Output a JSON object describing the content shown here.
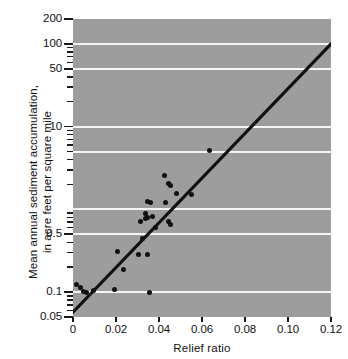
{
  "chart_data": {
    "type": "scatter",
    "title": "",
    "subtitle": "",
    "xlabel": "Relief ratio",
    "ylabel_line1": "Mean annual sediment accumulation,",
    "ylabel_line2": "in acre feet per square mile",
    "ylabel": "Mean annual sediment accumulation, in acre feet per square mile",
    "xscale": "linear",
    "yscale": "log",
    "xlim": [
      0,
      0.12
    ],
    "ylim": [
      0.05,
      200
    ],
    "grid": "horizontal-white-major",
    "legend": "none",
    "plot_background_color": "#9d9d9d",
    "gridline_color": "#f5f5f5",
    "marker_color": "#111111",
    "trendline_color": "#111111",
    "x_ticks": [
      "0",
      "0.02",
      "0.04",
      "0.06",
      "0.08",
      "0.10",
      "0.12"
    ],
    "x_tick_values": [
      0,
      0.02,
      0.04,
      0.06,
      0.08,
      0.1,
      0.12
    ],
    "y_ticks_labeled": [
      "200",
      "100",
      "50",
      "10",
      "0.5",
      "0.1",
      "0.05"
    ],
    "y_tick_values_labeled": [
      200,
      100,
      50,
      10,
      0.5,
      0.1,
      0.05
    ],
    "y_gridlines": [
      100,
      50,
      10,
      5,
      1,
      0.5,
      0.1
    ],
    "y_minor_ticks": [
      90,
      80,
      70,
      60,
      40,
      30,
      20,
      9,
      8,
      7,
      6,
      5,
      4,
      3,
      2,
      0.9,
      0.8,
      0.7,
      0.6,
      0.4,
      0.3,
      0.2,
      0.09,
      0.08,
      0.07,
      0.06
    ],
    "trendline": {
      "x": [
        0,
        0.12
      ],
      "y": [
        0.057,
        100
      ]
    },
    "points": [
      {
        "x": 0.0015,
        "y": 0.125
      },
      {
        "x": 0.0035,
        "y": 0.115
      },
      {
        "x": 0.005,
        "y": 0.101
      },
      {
        "x": 0.0065,
        "y": 0.1
      },
      {
        "x": 0.0095,
        "y": 0.104
      },
      {
        "x": 0.0195,
        "y": 0.108
      },
      {
        "x": 0.0205,
        "y": 0.31
      },
      {
        "x": 0.0235,
        "y": 0.185
      },
      {
        "x": 0.0305,
        "y": 0.285
      },
      {
        "x": 0.0315,
        "y": 0.72
      },
      {
        "x": 0.0325,
        "y": 0.45
      },
      {
        "x": 0.0335,
        "y": 0.9
      },
      {
        "x": 0.0335,
        "y": 0.78
      },
      {
        "x": 0.0345,
        "y": 1.25
      },
      {
        "x": 0.0345,
        "y": 0.285
      },
      {
        "x": 0.0348,
        "y": 0.8
      },
      {
        "x": 0.0355,
        "y": 0.098
      },
      {
        "x": 0.0362,
        "y": 1.2
      },
      {
        "x": 0.0372,
        "y": 0.82
      },
      {
        "x": 0.0385,
        "y": 0.6
      },
      {
        "x": 0.0425,
        "y": 2.6
      },
      {
        "x": 0.0432,
        "y": 1.22
      },
      {
        "x": 0.0442,
        "y": 0.72
      },
      {
        "x": 0.0445,
        "y": 2.05
      },
      {
        "x": 0.0452,
        "y": 1.95
      },
      {
        "x": 0.0452,
        "y": 0.66
      },
      {
        "x": 0.0482,
        "y": 1.55
      },
      {
        "x": 0.0552,
        "y": 1.5
      },
      {
        "x": 0.0635,
        "y": 5.1
      }
    ]
  }
}
